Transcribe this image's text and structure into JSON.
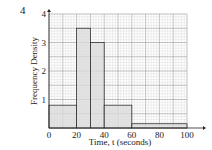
{
  "question_number": "4",
  "chart_data": {
    "type": "histogram",
    "title": "",
    "xlabel": "Time, t (seconds)",
    "ylabel": "Frequency Density",
    "xlim": [
      0,
      100
    ],
    "ylim": [
      0,
      4
    ],
    "x_ticks": [
      "0",
      "20",
      "40",
      "60",
      "80",
      "100"
    ],
    "y_ticks": [
      "1",
      "2",
      "3",
      "4"
    ],
    "grid": true,
    "bins": [
      {
        "from": 0,
        "to": 20,
        "frequency_density": 0.8
      },
      {
        "from": 20,
        "to": 30,
        "frequency_density": 3.5
      },
      {
        "from": 30,
        "to": 40,
        "frequency_density": 3.0
      },
      {
        "from": 40,
        "to": 60,
        "frequency_density": 0.8
      },
      {
        "from": 60,
        "to": 100,
        "frequency_density": 0.15
      }
    ],
    "bar_color": "#d9d9d9",
    "grid_color": "#bbbbbb"
  }
}
